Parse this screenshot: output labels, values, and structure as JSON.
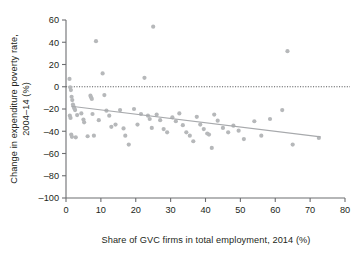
{
  "chart_data": {
    "type": "scatter",
    "title": "",
    "xlabel": "Share of GVC firms in total employment, 2014 (%)",
    "ylabel": "Change in expenditure poverty rate, 2004–14 (%)",
    "xlim": [
      0,
      80
    ],
    "ylim": [
      -100,
      60
    ],
    "xticks": [
      0,
      10,
      20,
      30,
      40,
      50,
      60,
      70,
      80
    ],
    "yticks": [
      -100,
      -80,
      -60,
      -40,
      -20,
      0,
      20,
      40,
      60
    ],
    "xtick_labels": [
      "0",
      "10",
      "20",
      "30",
      "40",
      "50",
      "60",
      "70",
      "80"
    ],
    "ytick_labels": [
      "-100",
      "-80",
      "-60",
      "-40",
      "-20",
      "0",
      "20",
      "40",
      "60"
    ],
    "grid": false,
    "legend": null,
    "point_color": "#b6b8ba",
    "trend_color": "#a7a9ac",
    "zero_line_color": "#58595b",
    "axis_color": "#6d6e71",
    "reference_lines": [
      {
        "name": "zero-line",
        "type": "horizontal",
        "y": 0,
        "style": "dotted"
      }
    ],
    "trend_line": {
      "name": "linear-fit",
      "x": [
        1.5,
        73.0
      ],
      "y": [
        -17.5,
        -45.0
      ],
      "style": "solid"
    },
    "points": [
      {
        "x": 1.0,
        "y": 7.0
      },
      {
        "x": 1.2,
        "y": -0.5
      },
      {
        "x": 1.4,
        "y": -3.0
      },
      {
        "x": 1.6,
        "y": -9.0
      },
      {
        "x": 1.8,
        "y": -12.0
      },
      {
        "x": 2.0,
        "y": -16.0
      },
      {
        "x": 2.2,
        "y": -18.0
      },
      {
        "x": 2.4,
        "y": -19.5
      },
      {
        "x": 2.6,
        "y": -21.0
      },
      {
        "x": 1.1,
        "y": -26.0
      },
      {
        "x": 1.3,
        "y": -28.0
      },
      {
        "x": 1.5,
        "y": -43.0
      },
      {
        "x": 1.7,
        "y": -45.0
      },
      {
        "x": 2.8,
        "y": -45.5
      },
      {
        "x": 3.2,
        "y": -25.5
      },
      {
        "x": 4.4,
        "y": -24.0
      },
      {
        "x": 5.0,
        "y": -29.5
      },
      {
        "x": 5.2,
        "y": -32.0
      },
      {
        "x": 6.2,
        "y": -44.5
      },
      {
        "x": 7.0,
        "y": -8.0
      },
      {
        "x": 7.2,
        "y": -9.5
      },
      {
        "x": 7.4,
        "y": -11.0
      },
      {
        "x": 7.6,
        "y": -24.5
      },
      {
        "x": 8.0,
        "y": -44.0
      },
      {
        "x": 8.6,
        "y": 41.0
      },
      {
        "x": 9.4,
        "y": -30.0
      },
      {
        "x": 10.5,
        "y": 12.0
      },
      {
        "x": 11.0,
        "y": -7.5
      },
      {
        "x": 11.6,
        "y": -21.5
      },
      {
        "x": 12.4,
        "y": -26.0
      },
      {
        "x": 13.0,
        "y": -36.0
      },
      {
        "x": 14.2,
        "y": -34.0
      },
      {
        "x": 15.5,
        "y": -21.0
      },
      {
        "x": 16.5,
        "y": -37.5
      },
      {
        "x": 17.0,
        "y": -44.0
      },
      {
        "x": 18.0,
        "y": -52.0
      },
      {
        "x": 19.5,
        "y": -20.0
      },
      {
        "x": 20.5,
        "y": -34.0
      },
      {
        "x": 21.5,
        "y": -24.5
      },
      {
        "x": 22.5,
        "y": 8.0
      },
      {
        "x": 23.5,
        "y": -26.0
      },
      {
        "x": 24.0,
        "y": -29.0
      },
      {
        "x": 24.6,
        "y": -37.0
      },
      {
        "x": 25.0,
        "y": 54.0
      },
      {
        "x": 26.0,
        "y": -25.0
      },
      {
        "x": 27.0,
        "y": -30.0
      },
      {
        "x": 28.0,
        "y": -38.0
      },
      {
        "x": 29.0,
        "y": -41.0
      },
      {
        "x": 30.5,
        "y": -27.5
      },
      {
        "x": 31.5,
        "y": -31.0
      },
      {
        "x": 32.5,
        "y": -24.0
      },
      {
        "x": 33.5,
        "y": -34.5
      },
      {
        "x": 34.5,
        "y": -41.0
      },
      {
        "x": 35.5,
        "y": -44.0
      },
      {
        "x": 36.5,
        "y": -49.0
      },
      {
        "x": 37.5,
        "y": -27.0
      },
      {
        "x": 38.5,
        "y": -34.0
      },
      {
        "x": 39.5,
        "y": -38.0
      },
      {
        "x": 40.5,
        "y": -42.0
      },
      {
        "x": 41.0,
        "y": -43.0
      },
      {
        "x": 41.8,
        "y": -55.0
      },
      {
        "x": 42.5,
        "y": -25.0
      },
      {
        "x": 43.5,
        "y": -30.5
      },
      {
        "x": 45.0,
        "y": -37.0
      },
      {
        "x": 46.5,
        "y": -41.0
      },
      {
        "x": 48.0,
        "y": -35.0
      },
      {
        "x": 49.5,
        "y": -39.5
      },
      {
        "x": 51.0,
        "y": -47.0
      },
      {
        "x": 54.0,
        "y": -31.0
      },
      {
        "x": 56.0,
        "y": -44.0
      },
      {
        "x": 58.5,
        "y": -29.0
      },
      {
        "x": 62.0,
        "y": -21.0
      },
      {
        "x": 63.5,
        "y": 32.0
      },
      {
        "x": 65.0,
        "y": -52.0
      },
      {
        "x": 72.5,
        "y": -46.0
      }
    ]
  },
  "figure": {
    "alt_name": "gvc-poverty-scatter"
  }
}
